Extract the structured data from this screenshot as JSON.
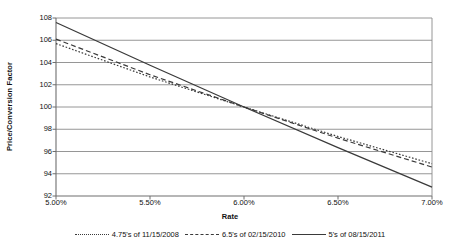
{
  "chart_data": {
    "type": "line",
    "title": "",
    "xlabel": "Rate",
    "ylabel": "Price/Conversion Factor",
    "xlim": [
      5.0,
      7.0
    ],
    "ylim": [
      92,
      108
    ],
    "grid": true,
    "grid_axis": "y",
    "legend_position": "bottom",
    "x_tick_labels": [
      "5.00%",
      "5.50%",
      "6.00%",
      "6.50%",
      "7.00%"
    ],
    "x_tick_values": [
      5.0,
      5.5,
      6.0,
      6.5,
      7.0
    ],
    "y_tick_labels": [
      "92",
      "94",
      "96",
      "98",
      "100",
      "102",
      "104",
      "106",
      "108"
    ],
    "y_tick_values": [
      92,
      94,
      96,
      98,
      100,
      102,
      104,
      106,
      108
    ],
    "x": [
      5.0,
      5.5,
      6.0,
      6.5,
      7.0
    ],
    "series": [
      {
        "name": "4.75's of 11/15/2008",
        "style": "dotted",
        "color": "#3a3a3a",
        "values": [
          105.7,
          102.7,
          100.0,
          97.35,
          94.9
        ]
      },
      {
        "name": "6.5's of 02/15/2010",
        "style": "dashed",
        "color": "#3a3a3a",
        "values": [
          106.1,
          102.9,
          100.0,
          97.2,
          94.6
        ]
      },
      {
        "name": "5's of 08/15/2011",
        "style": "solid",
        "color": "#3a3a3a",
        "values": [
          107.6,
          103.75,
          100.0,
          96.35,
          92.8
        ]
      }
    ]
  },
  "axes": {
    "ylabel": "Price/Conversion Factor",
    "xlabel": "Rate",
    "yticks": [
      "108",
      "106",
      "104",
      "102",
      "100",
      "98",
      "96",
      "94",
      "92"
    ],
    "xticks": [
      "5.00%",
      "5.50%",
      "6.00%",
      "6.50%",
      "7.00%"
    ]
  },
  "legend": {
    "entries": [
      {
        "label": "4.75's of 11/15/2008",
        "style": "dotted"
      },
      {
        "label": "6.5's of 02/15/2010",
        "style": "dashed"
      },
      {
        "label": "5's of 08/15/2011",
        "style": "solid"
      }
    ]
  },
  "colors": {
    "line": "#3a3a3a",
    "grid": "#8a8a8a",
    "axis": "#6e6e6e",
    "background": "#ffffff"
  }
}
